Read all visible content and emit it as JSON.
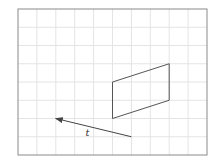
{
  "figure": {
    "partial_label": ")",
    "grid": {
      "left": 18,
      "top": 9,
      "right": 207,
      "bottom": 155,
      "cols": 10,
      "rows": 8,
      "line_color": "#e4e4e4",
      "border_color": "#8a8a8a"
    },
    "shape": {
      "type": "parallelogram",
      "vertices_grid": [
        [
          5,
          4
        ],
        [
          8,
          3
        ],
        [
          8,
          5
        ],
        [
          5,
          6
        ]
      ],
      "stroke": "#555555"
    },
    "vector": {
      "label": "t",
      "from_grid": [
        6,
        7
      ],
      "to_grid": [
        2,
        6
      ],
      "stroke": "#444444"
    }
  }
}
